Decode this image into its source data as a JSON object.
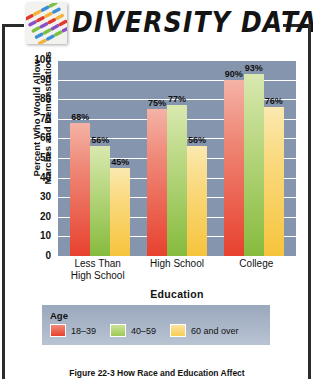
{
  "header": {
    "title": "DIVERSITY DATA",
    "logo_icon": "colored-dashes-grid-icon"
  },
  "chart_data": {
    "type": "bar",
    "title": "",
    "categories": [
      "Less Than High School",
      "High School",
      "College"
    ],
    "category_lines": [
      [
        "Less Than",
        "High School"
      ],
      [
        "High School"
      ],
      [
        "College"
      ]
    ],
    "series": [
      {
        "name": "18–39",
        "values": [
          68,
          75,
          90
        ],
        "color": "#e8412f"
      },
      {
        "name": "40–59",
        "values": [
          56,
          77,
          93
        ],
        "color": "#86bb3e"
      },
      {
        "name": "60 and over",
        "values": [
          45,
          56,
          76
        ],
        "color": "#f6c43c"
      }
    ],
    "value_labels": [
      [
        "68%",
        "56%",
        "45%"
      ],
      [
        "75%",
        "77%",
        "56%"
      ],
      [
        "90%",
        "93%",
        "76%"
      ]
    ],
    "xlabel": "Education",
    "ylabel": "Percent Who Would Allow Marches and Demonstrations",
    "ylabel_lines": [
      "Percent Who Would Allow",
      "Marches and Demonstrations"
    ],
    "ylim": [
      0,
      100
    ],
    "yticks": [
      0,
      10,
      20,
      30,
      40,
      50,
      60,
      70,
      80,
      90,
      100
    ],
    "grid": true,
    "legend_position": "bottom",
    "plot_background": "#8595ad",
    "gridline_color": "#ffffff"
  },
  "legend": {
    "title": "Age",
    "items": [
      {
        "label": "18–39"
      },
      {
        "label": "40–59"
      },
      {
        "label": "60 and over"
      }
    ]
  },
  "caption": {
    "text": "Figure 22-3   How Race and Education Affect"
  }
}
